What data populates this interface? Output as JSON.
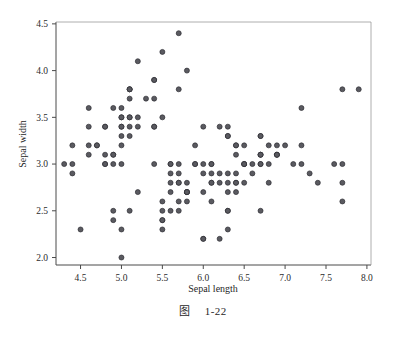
{
  "figure": {
    "caption_prefix": "图",
    "caption_number": "1-22"
  },
  "chart_data": {
    "type": "scatter",
    "title": "",
    "xlabel": "Sepal length",
    "ylabel": "Sepal width",
    "xlim": [
      4.2,
      8.05
    ],
    "ylim": [
      1.92,
      4.52
    ],
    "xticks": [
      "4.5",
      "5.0",
      "5.5",
      "6.0",
      "6.5",
      "7.0",
      "7.5",
      "8.0"
    ],
    "xtick_values": [
      4.5,
      5.0,
      5.5,
      6.0,
      6.5,
      7.0,
      7.5,
      8.0
    ],
    "yticks": [
      "2.0",
      "2.5",
      "3.0",
      "3.5",
      "4.0",
      "4.5"
    ],
    "ytick_values": [
      2.0,
      2.5,
      3.0,
      3.5,
      4.0,
      4.5
    ],
    "grid": false,
    "legend": false,
    "marker": {
      "shape": "circle",
      "size": 5,
      "fill": "#5a5a60",
      "edge": "#2e2e33"
    },
    "point_count": 150,
    "x": [
      5.1,
      4.9,
      4.7,
      4.6,
      5.0,
      5.4,
      4.6,
      5.0,
      4.4,
      4.9,
      5.4,
      4.8,
      4.8,
      4.3,
      5.8,
      5.7,
      5.4,
      5.1,
      5.7,
      5.1,
      5.4,
      5.1,
      4.6,
      5.1,
      4.8,
      5.0,
      5.0,
      5.2,
      5.2,
      4.7,
      4.8,
      5.4,
      5.2,
      5.5,
      4.9,
      5.0,
      5.5,
      4.9,
      4.4,
      5.1,
      5.0,
      4.5,
      4.4,
      5.0,
      5.1,
      4.8,
      5.1,
      4.6,
      5.3,
      5.0,
      7.0,
      6.4,
      6.9,
      5.5,
      6.5,
      5.7,
      6.3,
      4.9,
      6.6,
      5.2,
      5.0,
      5.9,
      6.0,
      6.1,
      5.6,
      6.7,
      5.6,
      5.8,
      6.2,
      5.6,
      5.9,
      6.1,
      6.3,
      6.1,
      6.4,
      6.6,
      6.8,
      6.7,
      6.0,
      5.7,
      5.5,
      5.5,
      5.8,
      6.0,
      5.4,
      6.0,
      6.7,
      6.3,
      5.6,
      5.5,
      5.5,
      6.1,
      5.8,
      5.0,
      5.6,
      5.7,
      5.7,
      6.2,
      5.1,
      5.7,
      6.3,
      5.8,
      7.1,
      6.3,
      6.5,
      7.6,
      4.9,
      7.3,
      6.7,
      7.2,
      6.5,
      6.4,
      6.8,
      5.7,
      5.8,
      6.4,
      6.5,
      7.7,
      7.7,
      6.0,
      6.9,
      5.6,
      7.7,
      6.3,
      6.7,
      7.2,
      6.2,
      6.1,
      6.4,
      7.2,
      7.4,
      7.9,
      6.4,
      6.3,
      6.1,
      7.7,
      6.3,
      6.4,
      6.0,
      6.9,
      6.7,
      6.9,
      5.8,
      6.8,
      6.7,
      6.7,
      6.3,
      6.5,
      6.2,
      5.9
    ],
    "y": [
      3.5,
      3.0,
      3.2,
      3.1,
      3.6,
      3.9,
      3.4,
      3.4,
      2.9,
      3.1,
      3.7,
      3.4,
      3.0,
      3.0,
      4.0,
      4.4,
      3.9,
      3.5,
      3.8,
      3.8,
      3.4,
      3.7,
      3.6,
      3.3,
      3.4,
      3.0,
      3.4,
      3.5,
      3.4,
      3.2,
      3.1,
      3.4,
      4.1,
      4.2,
      3.1,
      3.2,
      3.5,
      3.6,
      3.0,
      3.4,
      3.5,
      2.3,
      3.2,
      3.5,
      3.8,
      3.0,
      3.8,
      3.2,
      3.7,
      3.3,
      3.2,
      3.2,
      3.1,
      2.3,
      2.8,
      2.8,
      3.3,
      2.4,
      2.9,
      2.7,
      2.0,
      3.0,
      2.2,
      2.9,
      2.9,
      3.1,
      3.0,
      2.7,
      2.2,
      2.5,
      3.2,
      2.8,
      2.5,
      2.8,
      2.9,
      3.0,
      2.8,
      3.0,
      2.9,
      2.6,
      2.4,
      2.4,
      2.7,
      2.7,
      3.0,
      3.4,
      3.1,
      2.3,
      3.0,
      2.5,
      2.6,
      3.0,
      2.6,
      2.3,
      2.7,
      3.0,
      2.9,
      2.9,
      2.5,
      2.8,
      3.3,
      2.7,
      3.0,
      2.9,
      3.0,
      3.0,
      2.5,
      2.9,
      2.5,
      3.6,
      3.2,
      2.7,
      3.0,
      2.5,
      2.8,
      3.2,
      3.0,
      3.8,
      2.6,
      2.2,
      3.2,
      2.8,
      2.8,
      2.7,
      3.3,
      3.2,
      2.8,
      3.0,
      2.8,
      3.0,
      2.8,
      3.8,
      2.8,
      2.8,
      2.6,
      3.0,
      3.4,
      3.1,
      3.0,
      3.1,
      3.1,
      3.1,
      2.7,
      3.2,
      3.3,
      3.0,
      2.5,
      3.0,
      3.4,
      3.0
    ]
  }
}
